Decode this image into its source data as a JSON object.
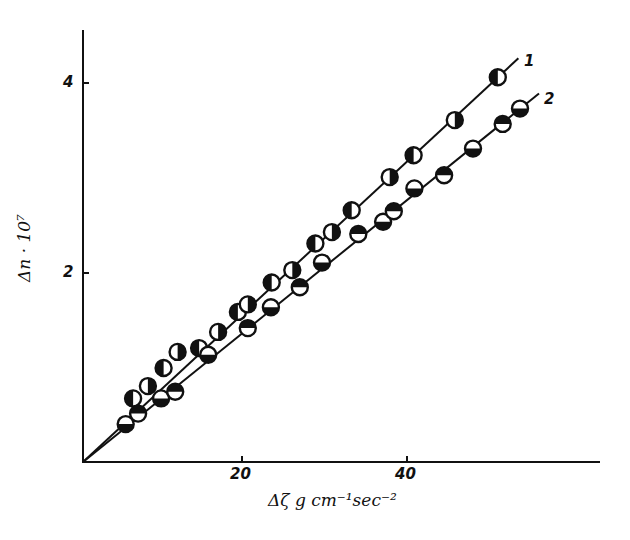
{
  "chart_data": {
    "type": "scatter",
    "title": "",
    "xlabel": "Δζ g cm⁻¹ sec⁻²",
    "ylabel": "Δn · 10⁷",
    "xlim": [
      0,
      62
    ],
    "ylim": [
      0,
      4.6
    ],
    "grid": false,
    "x_ticks": [
      20,
      40
    ],
    "x_tick_labels": [
      "20",
      "40"
    ],
    "y_ticks": [
      2,
      4
    ],
    "y_tick_labels": [
      "2",
      "4"
    ],
    "legend": "inline line labels at end of fit lines",
    "series": [
      {
        "name": "1",
        "marker": "circle half-filled (left/right)",
        "fit": "straight line through origin",
        "points": [
          {
            "x": 6.8,
            "y": 0.68
          },
          {
            "x": 8.6,
            "y": 0.81
          },
          {
            "x": 10.5,
            "y": 1.0
          },
          {
            "x": 12.2,
            "y": 1.17
          },
          {
            "x": 14.8,
            "y": 1.21
          },
          {
            "x": 17.1,
            "y": 1.38
          },
          {
            "x": 19.5,
            "y": 1.59
          },
          {
            "x": 20.7,
            "y": 1.67
          },
          {
            "x": 23.6,
            "y": 1.9
          },
          {
            "x": 26.1,
            "y": 2.03
          },
          {
            "x": 28.9,
            "y": 2.31
          },
          {
            "x": 30.9,
            "y": 2.43
          },
          {
            "x": 33.3,
            "y": 2.66
          },
          {
            "x": 37.9,
            "y": 3.01
          },
          {
            "x": 40.8,
            "y": 3.24
          },
          {
            "x": 45.8,
            "y": 3.61
          },
          {
            "x": 51.0,
            "y": 4.06
          }
        ],
        "line_end": {
          "x": 53.5,
          "y": 4.26
        }
      },
      {
        "name": "2",
        "marker": "circle half-filled (top/bottom)",
        "fit": "straight line through origin",
        "points": [
          {
            "x": 5.9,
            "y": 0.41
          },
          {
            "x": 7.4,
            "y": 0.52
          },
          {
            "x": 10.2,
            "y": 0.68
          },
          {
            "x": 11.9,
            "y": 0.75
          },
          {
            "x": 15.9,
            "y": 1.14
          },
          {
            "x": 20.7,
            "y": 1.42
          },
          {
            "x": 23.5,
            "y": 1.64
          },
          {
            "x": 27.0,
            "y": 1.85
          },
          {
            "x": 29.7,
            "y": 2.11
          },
          {
            "x": 34.1,
            "y": 2.41
          },
          {
            "x": 37.1,
            "y": 2.54
          },
          {
            "x": 38.4,
            "y": 2.65
          },
          {
            "x": 40.9,
            "y": 2.89
          },
          {
            "x": 44.5,
            "y": 3.03
          },
          {
            "x": 48.0,
            "y": 3.31
          },
          {
            "x": 51.6,
            "y": 3.57
          },
          {
            "x": 53.7,
            "y": 3.73
          }
        ],
        "line_end": {
          "x": 56.0,
          "y": 3.89
        }
      }
    ]
  },
  "labels": {
    "x_tick_20": "20",
    "x_tick_40": "40",
    "y_tick_2": "2",
    "y_tick_4": "4",
    "x_axis_title": "Δζ g cm⁻¹sec⁻²",
    "y_axis_title": "Δn · 10⁷",
    "series_1_label": "1",
    "series_2_label": "2"
  },
  "colors": {
    "ink": "#111111",
    "background": "#ffffff"
  }
}
